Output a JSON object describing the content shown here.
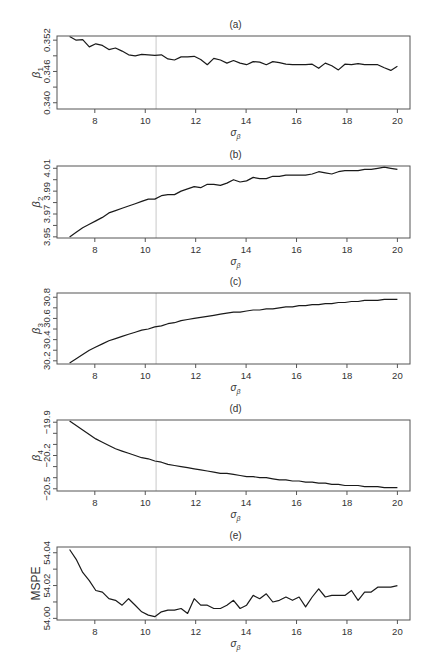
{
  "figure": {
    "caption_fragment": ""
  },
  "chart_data": [
    {
      "type": "line",
      "panel": "(a)",
      "title": "(a)",
      "xlabel": "σβ",
      "ylabel": "β1",
      "xlim": [
        6.5,
        20.5
      ],
      "ylim": [
        0.3388,
        0.3528
      ],
      "xticks": [
        8,
        10,
        12,
        14,
        16,
        18,
        20
      ],
      "yticks": [
        0.34,
        0.343,
        0.346,
        0.349,
        0.352
      ],
      "ytick_labels": [
        "0.340",
        "",
        "0.346",
        "",
        "0.352"
      ],
      "vline": 10.43,
      "box": [
        57,
        36,
        410,
        109
      ],
      "x": [
        7.0,
        7.26,
        7.52,
        7.78,
        8.04,
        8.3,
        8.56,
        8.82,
        9.08,
        9.34,
        9.6,
        9.86,
        10.12,
        10.38,
        10.64,
        10.9,
        11.16,
        11.42,
        11.68,
        11.94,
        12.2,
        12.46,
        12.72,
        12.98,
        13.24,
        13.5,
        13.76,
        14.02,
        14.28,
        14.54,
        14.8,
        15.06,
        15.32,
        15.58,
        15.84,
        16.1,
        16.36,
        16.62,
        16.88,
        17.14,
        17.4,
        17.66,
        17.92,
        18.18,
        18.44,
        18.7,
        18.96,
        19.22,
        19.48,
        19.74,
        20.0
      ],
      "values": [
        0.3527,
        0.352,
        0.3521,
        0.3507,
        0.3513,
        0.351,
        0.3502,
        0.3505,
        0.3499,
        0.3492,
        0.349,
        0.3493,
        0.3492,
        0.3491,
        0.3492,
        0.3484,
        0.3482,
        0.3488,
        0.3488,
        0.3489,
        0.3483,
        0.3473,
        0.3485,
        0.3482,
        0.3476,
        0.3481,
        0.3476,
        0.3473,
        0.3479,
        0.3478,
        0.3473,
        0.3479,
        0.3477,
        0.3474,
        0.3473,
        0.3473,
        0.3473,
        0.3474,
        0.3466,
        0.3476,
        0.3471,
        0.3463,
        0.3474,
        0.3473,
        0.3475,
        0.3473,
        0.3473,
        0.3473,
        0.3467,
        0.3462,
        0.347
      ]
    },
    {
      "type": "line",
      "panel": "(b)",
      "title": "(b)",
      "xlabel": "σβ",
      "ylabel": "β2",
      "xlim": [
        6.5,
        20.5
      ],
      "ylim": [
        3.949,
        4.012
      ],
      "xticks": [
        8,
        10,
        12,
        14,
        16,
        18,
        20
      ],
      "yticks": [
        3.95,
        3.96,
        3.97,
        3.98,
        3.99,
        4.0,
        4.01
      ],
      "ytick_labels": [
        "3.95",
        "",
        "3.97",
        "",
        "3.99",
        "",
        "4.01"
      ],
      "vline": 10.43,
      "box": [
        57,
        166,
        410,
        238
      ],
      "x": [
        7.0,
        7.26,
        7.52,
        7.78,
        8.04,
        8.3,
        8.56,
        8.82,
        9.08,
        9.34,
        9.6,
        9.86,
        10.12,
        10.38,
        10.64,
        10.9,
        11.16,
        11.42,
        11.68,
        11.94,
        12.2,
        12.46,
        12.72,
        12.98,
        13.24,
        13.5,
        13.76,
        14.02,
        14.28,
        14.54,
        14.8,
        15.06,
        15.32,
        15.58,
        15.84,
        16.1,
        16.36,
        16.62,
        16.88,
        17.14,
        17.4,
        17.66,
        17.92,
        18.18,
        18.44,
        18.7,
        18.96,
        19.22,
        19.48,
        19.74,
        20.0
      ],
      "values": [
        3.95,
        3.954,
        3.958,
        3.961,
        3.964,
        3.967,
        3.971,
        3.973,
        3.975,
        3.977,
        3.979,
        3.981,
        3.983,
        3.983,
        3.986,
        3.987,
        3.987,
        3.99,
        3.992,
        3.994,
        3.993,
        3.996,
        3.996,
        3.995,
        3.997,
        4.0,
        3.998,
        3.999,
        4.002,
        4.001,
        4.001,
        4.003,
        4.003,
        4.004,
        4.004,
        4.004,
        4.004,
        4.005,
        4.007,
        4.006,
        4.005,
        4.007,
        4.008,
        4.008,
        4.008,
        4.009,
        4.009,
        4.01,
        4.011,
        4.01,
        4.009
      ]
    },
    {
      "type": "line",
      "panel": "(c)",
      "title": "(c)",
      "xlabel": "σβ",
      "ylabel": "β3",
      "xlim": [
        6.5,
        20.5
      ],
      "ylim": [
        30.17,
        30.84
      ],
      "xticks": [
        8,
        10,
        12,
        14,
        16,
        18,
        20
      ],
      "yticks": [
        30.2,
        30.3,
        30.4,
        30.5,
        30.6,
        30.7,
        30.8
      ],
      "ytick_labels": [
        "30.2",
        "",
        "30.4",
        "",
        "30.6",
        "",
        "30.8"
      ],
      "vline": 10.43,
      "box": [
        57,
        293,
        410,
        364
      ],
      "x": [
        7.0,
        7.26,
        7.52,
        7.78,
        8.04,
        8.3,
        8.56,
        8.82,
        9.08,
        9.34,
        9.6,
        9.86,
        10.12,
        10.38,
        10.64,
        10.9,
        11.16,
        11.42,
        11.68,
        11.94,
        12.2,
        12.46,
        12.72,
        12.98,
        13.24,
        13.5,
        13.76,
        14.02,
        14.28,
        14.54,
        14.8,
        15.06,
        15.32,
        15.58,
        15.84,
        16.1,
        16.36,
        16.62,
        16.88,
        17.14,
        17.4,
        17.66,
        17.92,
        18.18,
        18.44,
        18.7,
        18.96,
        19.22,
        19.48,
        19.74,
        20.0
      ],
      "values": [
        30.18,
        30.22,
        30.26,
        30.3,
        30.33,
        30.36,
        30.39,
        30.41,
        30.43,
        30.45,
        30.47,
        30.49,
        30.5,
        30.52,
        30.53,
        30.55,
        30.56,
        30.58,
        30.59,
        30.6,
        30.61,
        30.62,
        30.63,
        30.64,
        30.65,
        30.66,
        30.66,
        30.67,
        30.68,
        30.68,
        30.69,
        30.69,
        30.7,
        30.71,
        30.71,
        30.72,
        30.72,
        30.73,
        30.73,
        30.74,
        30.74,
        30.75,
        30.75,
        30.76,
        30.76,
        30.77,
        30.77,
        30.77,
        30.78,
        30.78,
        30.78
      ]
    },
    {
      "type": "line",
      "panel": "(d)",
      "title": "(d)",
      "xlabel": "σβ",
      "ylabel": "β4",
      "xlim": [
        6.5,
        20.5
      ],
      "ylim": [
        -20.52,
        -19.88
      ],
      "xticks": [
        8,
        10,
        12,
        14,
        16,
        18,
        20
      ],
      "yticks": [
        -20.5,
        -20.4,
        -20.3,
        -20.2,
        -20.1,
        -20.0,
        -19.9
      ],
      "ytick_labels": [
        "-20.5",
        "",
        "",
        "-20.2",
        "",
        "",
        "-19.9"
      ],
      "vline": 10.43,
      "box": [
        57,
        420,
        410,
        491
      ],
      "x": [
        7.0,
        7.26,
        7.52,
        7.78,
        8.04,
        8.3,
        8.56,
        8.82,
        9.08,
        9.34,
        9.6,
        9.86,
        10.12,
        10.38,
        10.64,
        10.9,
        11.16,
        11.42,
        11.68,
        11.94,
        12.2,
        12.46,
        12.72,
        12.98,
        13.24,
        13.5,
        13.76,
        14.02,
        14.28,
        14.54,
        14.8,
        15.06,
        15.32,
        15.58,
        15.84,
        16.1,
        16.36,
        16.62,
        16.88,
        17.14,
        17.4,
        17.66,
        17.92,
        18.18,
        18.44,
        18.7,
        18.96,
        19.22,
        19.48,
        19.74,
        20.0
      ],
      "values": [
        -19.89,
        -19.93,
        -19.97,
        -20.01,
        -20.05,
        -20.08,
        -20.11,
        -20.14,
        -20.16,
        -20.18,
        -20.2,
        -20.22,
        -20.23,
        -20.25,
        -20.26,
        -20.28,
        -20.29,
        -20.3,
        -20.31,
        -20.32,
        -20.33,
        -20.34,
        -20.35,
        -20.36,
        -20.36,
        -20.37,
        -20.38,
        -20.39,
        -20.39,
        -20.4,
        -20.4,
        -20.41,
        -20.42,
        -20.42,
        -20.43,
        -20.43,
        -20.44,
        -20.44,
        -20.45,
        -20.45,
        -20.46,
        -20.46,
        -20.47,
        -20.47,
        -20.47,
        -20.48,
        -20.48,
        -20.48,
        -20.49,
        -20.49,
        -20.49
      ]
    },
    {
      "type": "line",
      "panel": "(e)",
      "title": "(e)",
      "xlabel": "σβ",
      "ylabel": "MSPE",
      "xlim": [
        6.5,
        20.5
      ],
      "ylim": [
        53.999,
        54.0435
      ],
      "xticks": [
        8,
        10,
        12,
        14,
        16,
        18,
        20
      ],
      "yticks": [
        54.0,
        54.01,
        54.02,
        54.03,
        54.04
      ],
      "ytick_labels": [
        "54.00",
        "",
        "54.02",
        "",
        "54.04"
      ],
      "vline": 10.43,
      "box": [
        57,
        547,
        410,
        620
      ],
      "x": [
        7.0,
        7.26,
        7.52,
        7.78,
        8.04,
        8.3,
        8.56,
        8.82,
        9.08,
        9.34,
        9.6,
        9.86,
        10.12,
        10.38,
        10.64,
        10.9,
        11.16,
        11.42,
        11.68,
        11.94,
        12.2,
        12.46,
        12.72,
        12.98,
        13.24,
        13.5,
        13.76,
        14.02,
        14.28,
        14.54,
        14.8,
        15.06,
        15.32,
        15.58,
        15.84,
        16.1,
        16.36,
        16.62,
        16.88,
        17.14,
        17.4,
        17.66,
        17.92,
        18.18,
        18.44,
        18.7,
        18.96,
        19.22,
        19.48,
        19.74,
        20.0
      ],
      "values": [
        54.042,
        54.036,
        54.028,
        54.023,
        54.017,
        54.016,
        54.012,
        54.011,
        54.008,
        54.012,
        54.008,
        54.004,
        54.002,
        54.001,
        54.004,
        54.005,
        54.005,
        54.006,
        54.003,
        54.012,
        54.008,
        54.008,
        54.006,
        54.006,
        54.008,
        54.011,
        54.006,
        54.008,
        54.014,
        54.012,
        54.015,
        54.01,
        54.011,
        54.013,
        54.011,
        54.013,
        54.007,
        54.013,
        54.018,
        54.013,
        54.014,
        54.014,
        54.014,
        54.017,
        54.011,
        54.016,
        54.016,
        54.019,
        54.019,
        54.019,
        54.02
      ]
    }
  ]
}
